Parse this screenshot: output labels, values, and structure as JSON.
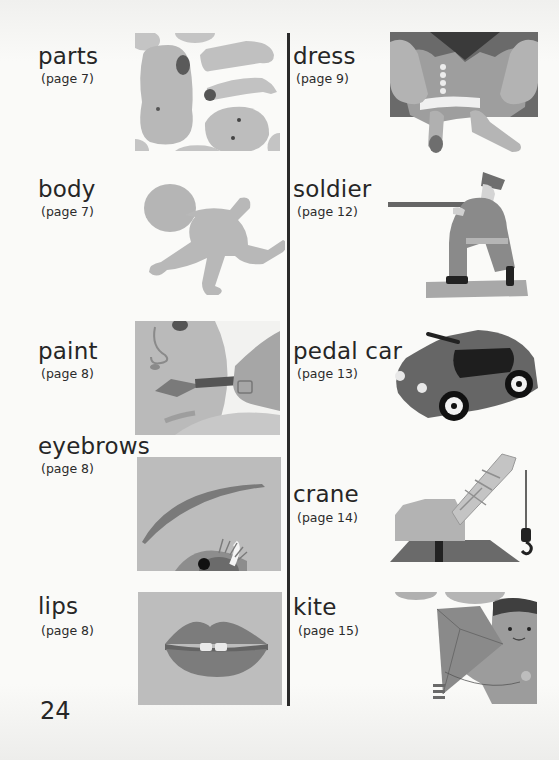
{
  "page_number": "24",
  "left_column": [
    {
      "word": "parts",
      "ref": "(page 7)",
      "image": "doll-parts-illustration"
    },
    {
      "word": "body",
      "ref": "(page 7)",
      "image": "baby-doll-body-illustration"
    },
    {
      "word": "paint",
      "ref": "(page 8)",
      "image": "painting-doll-lips-illustration"
    },
    {
      "word": "eyebrows",
      "ref": "(page 8)",
      "image": "eyebrow-and-eye-illustration"
    },
    {
      "word": "lips",
      "ref": "(page 8)",
      "image": "lips-illustration"
    }
  ],
  "right_column": [
    {
      "word": "dress",
      "ref": "(page 9)",
      "image": "dressing-doll-illustration"
    },
    {
      "word": "soldier",
      "ref": "(page 12)",
      "image": "kneeling-toy-soldier-illustration"
    },
    {
      "word": "pedal car",
      "ref": "(page 13)",
      "image": "toy-pedal-car-illustration"
    },
    {
      "word": "crane",
      "ref": "(page 14)",
      "image": "toy-crane-illustration"
    },
    {
      "word": "kite",
      "ref": "(page 15)",
      "image": "boy-with-kite-illustration"
    }
  ],
  "colors": {
    "paper": "#fafaf8",
    "ink": "#262626",
    "light_gray": "#c9c9c9",
    "mid_gray": "#a8a8a8",
    "dark_gray": "#6e6e6e"
  }
}
